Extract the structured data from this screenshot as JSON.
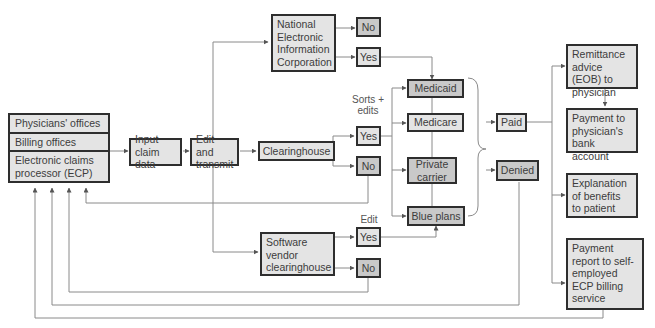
{
  "diagram": {
    "source": {
      "physicians_offices": "Physicians' offices",
      "billing_offices": "Billing offices",
      "ecp": "Electronic claims processor (ECP)"
    },
    "input_claim_data": "Input claim data",
    "edit_and_transmit": "Edit and transmit",
    "neic": "National Electronic Information Corporation",
    "neic_no": "No",
    "neic_yes": "Yes",
    "clearinghouse": "Clearinghouse",
    "clearinghouse_label": "Sorts + edits",
    "clearinghouse_yes": "Yes",
    "clearinghouse_no": "No",
    "software_vendor": "Software vendor clearinghouse",
    "software_vendor_label": "Edit",
    "software_vendor_yes": "Yes",
    "software_vendor_no": "No",
    "payers": {
      "medicaid": "Medicaid",
      "medicare": "Medicare",
      "private_carrier": "Private carrier",
      "blue_plans": "Blue plans"
    },
    "paid": "Paid",
    "denied": "Denied",
    "outcomes": {
      "remittance": "Remittance advice (EOB) to physician",
      "payment_bank": "Payment to physician's bank account",
      "eob_patient": "Explanation of benefits to patient",
      "payment_report": "Payment report to self-employed ECP billing service"
    }
  },
  "colors": {
    "light_fill": "#e4e4e4",
    "dark_fill": "#c9c9c9",
    "border": "#2e2e2e",
    "line": "#8a8a8a"
  }
}
